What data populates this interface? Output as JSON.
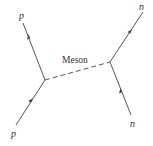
{
  "diagram": {
    "type": "feynman-diagram",
    "particles": {
      "incoming_left": "p",
      "outgoing_left": "p",
      "incoming_right": "n",
      "outgoing_right": "n"
    },
    "exchange_label": "Meson",
    "colors": {
      "line": "#555555",
      "text": "#333333"
    }
  }
}
